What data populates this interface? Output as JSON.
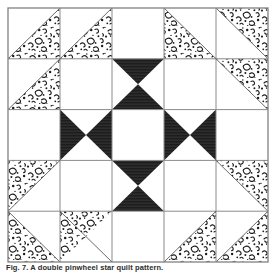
{
  "figure": {
    "caption": "Fig. 7. A double pinwheel star quilt pattern.",
    "block": {
      "name": "quilt-block",
      "grid_rows": 5,
      "grid_cols": 5,
      "x": 8,
      "y": 8,
      "width": 260,
      "height": 254,
      "line_color": "#8a8a8a",
      "line_width": 1,
      "outer_border_color": "#8a8a8a"
    },
    "colors": {
      "background": "#ffffff",
      "dark_fabric": "#262626",
      "light_fabric": "#ffffff",
      "print_fabric_base": "#ffffff",
      "print_fabric_mark": "#1c1c1c",
      "grid_line": "#8a8a8a"
    },
    "legend": {
      "dark_label": "dark solid",
      "print_label": "printed calico",
      "light_label": "background white"
    },
    "cells": [
      {
        "r": 0,
        "c": 0,
        "unit": "half-square-triangle",
        "fill": "print",
        "corner": "bottom-right"
      },
      {
        "r": 0,
        "c": 1,
        "unit": "half-square-triangle",
        "fill": "print",
        "corner": "bottom-right"
      },
      {
        "r": 0,
        "c": 2,
        "unit": "plain",
        "fill": "light",
        "corner": ""
      },
      {
        "r": 0,
        "c": 3,
        "unit": "half-square-triangle",
        "fill": "print",
        "corner": "bottom-left"
      },
      {
        "r": 0,
        "c": 4,
        "unit": "half-square-triangle",
        "fill": "print",
        "corner": "top-right"
      },
      {
        "r": 1,
        "c": 0,
        "unit": "half-square-triangle",
        "fill": "print",
        "corner": "bottom-right"
      },
      {
        "r": 1,
        "c": 1,
        "unit": "plain",
        "fill": "light",
        "corner": ""
      },
      {
        "r": 1,
        "c": 2,
        "unit": "hourglass-vertical",
        "fill": "dark",
        "corner": ""
      },
      {
        "r": 1,
        "c": 3,
        "unit": "plain",
        "fill": "light",
        "corner": ""
      },
      {
        "r": 1,
        "c": 4,
        "unit": "half-square-triangle",
        "fill": "print",
        "corner": "top-right"
      },
      {
        "r": 2,
        "c": 0,
        "unit": "plain",
        "fill": "light",
        "corner": ""
      },
      {
        "r": 2,
        "c": 1,
        "unit": "hourglass-horizontal",
        "fill": "dark",
        "corner": ""
      },
      {
        "r": 2,
        "c": 2,
        "unit": "plain",
        "fill": "light",
        "corner": ""
      },
      {
        "r": 2,
        "c": 3,
        "unit": "hourglass-horizontal",
        "fill": "dark",
        "corner": ""
      },
      {
        "r": 2,
        "c": 4,
        "unit": "plain",
        "fill": "light",
        "corner": ""
      },
      {
        "r": 3,
        "c": 0,
        "unit": "half-square-triangle",
        "fill": "print",
        "corner": "top-left"
      },
      {
        "r": 3,
        "c": 1,
        "unit": "plain",
        "fill": "light",
        "corner": ""
      },
      {
        "r": 3,
        "c": 2,
        "unit": "hourglass-vertical",
        "fill": "dark",
        "corner": ""
      },
      {
        "r": 3,
        "c": 3,
        "unit": "plain",
        "fill": "light",
        "corner": ""
      },
      {
        "r": 3,
        "c": 4,
        "unit": "half-square-triangle",
        "fill": "print",
        "corner": "top-right"
      },
      {
        "r": 4,
        "c": 0,
        "unit": "half-square-triangle",
        "fill": "print",
        "corner": "bottom-left"
      },
      {
        "r": 4,
        "c": 1,
        "unit": "half-square-triangle",
        "fill": "print",
        "corner": "top-left"
      },
      {
        "r": 4,
        "c": 2,
        "unit": "plain",
        "fill": "light",
        "corner": ""
      },
      {
        "r": 4,
        "c": 3,
        "unit": "half-square-triangle",
        "fill": "print",
        "corner": "bottom-right"
      },
      {
        "r": 4,
        "c": 4,
        "unit": "half-square-triangle",
        "fill": "print",
        "corner": "bottom-right"
      }
    ]
  }
}
